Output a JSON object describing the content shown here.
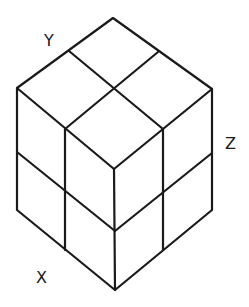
{
  "diagram": {
    "labels": {
      "x": "X",
      "y": "Y",
      "z": "Z"
    },
    "stroke_color": "#1a1a1a",
    "background": "#ffffff",
    "grid_divisions": 2
  }
}
